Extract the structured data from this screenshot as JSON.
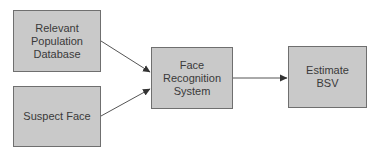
{
  "diagram": {
    "type": "flowchart",
    "colors": {
      "node_fill": "#c9c9c9",
      "node_border": "#6f6f6f",
      "text": "#3a3a3a",
      "edge": "#555555",
      "background": "#ffffff"
    },
    "nodes": [
      {
        "id": "db",
        "label": "Relevant\nPopulation\nDatabase"
      },
      {
        "id": "face",
        "label": "Suspect Face"
      },
      {
        "id": "frs",
        "label": "Face\nRecognition\nSystem"
      },
      {
        "id": "bsv",
        "label": "Estimate\nBSV"
      }
    ],
    "edges": [
      {
        "from": "db",
        "to": "frs"
      },
      {
        "from": "face",
        "to": "frs"
      },
      {
        "from": "frs",
        "to": "bsv"
      }
    ]
  }
}
